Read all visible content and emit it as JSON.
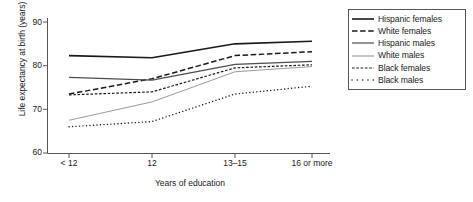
{
  "chart_data": {
    "type": "line",
    "title": "",
    "xlabel": "Years of education",
    "ylabel": "Life expectancy at birth (years)",
    "categories": [
      "< 12",
      "12",
      "13–15",
      "16 or more"
    ],
    "ylim": [
      60,
      90
    ],
    "yticks": [
      60,
      70,
      80,
      90
    ],
    "grid": false,
    "legend_position": "top-right",
    "series": [
      {
        "name": "Hispanic females",
        "values": [
          82.3,
          81.8,
          85.0,
          85.6
        ],
        "style": "solid",
        "color": "#1a1a1a",
        "width": 1.6
      },
      {
        "name": "White females",
        "values": [
          73.5,
          77.0,
          82.3,
          83.2
        ],
        "style": "dashed",
        "color": "#1a1a1a",
        "width": 1.5
      },
      {
        "name": "Hispanic males",
        "values": [
          77.3,
          76.7,
          80.3,
          81.0
        ],
        "style": "solid",
        "color": "#4d4d4d",
        "width": 1.2
      },
      {
        "name": "White males",
        "values": [
          67.5,
          71.7,
          78.6,
          79.8
        ],
        "style": "solid",
        "color": "#9a9a9a",
        "width": 1.0
      },
      {
        "name": "Black females",
        "values": [
          73.3,
          74.0,
          79.5,
          80.2
        ],
        "style": "fine-dashed",
        "color": "#1a1a1a",
        "width": 1.2
      },
      {
        "name": "Black males",
        "values": [
          66.0,
          67.2,
          73.5,
          75.3
        ],
        "style": "dotted",
        "color": "#1a1a1a",
        "width": 1.4
      }
    ]
  },
  "axis": {
    "ytick_labels": [
      "90",
      "80",
      "70",
      "60"
    ],
    "xtick_labels": [
      "< 12",
      "12",
      "13–15",
      "16 or more"
    ],
    "ylabel": "Life expectancy at birth (years)",
    "xlabel": "Years of education"
  },
  "legend": {
    "items": [
      {
        "label": "Hispanic females",
        "icon": "solid-line-icon"
      },
      {
        "label": "White females",
        "icon": "dashed-line-icon"
      },
      {
        "label": "Hispanic males",
        "icon": "solid-gray-line-icon"
      },
      {
        "label": "White males",
        "icon": "solid-light-line-icon"
      },
      {
        "label": "Black females",
        "icon": "fine-dashed-line-icon"
      },
      {
        "label": "Black males",
        "icon": "dotted-line-icon"
      }
    ]
  }
}
